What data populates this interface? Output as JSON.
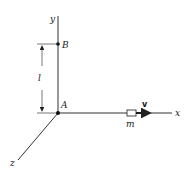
{
  "diagram": {
    "axes": {
      "x_label": "x",
      "y_label": "y",
      "z_label": "z"
    },
    "points": {
      "origin_label": "A",
      "upper_label": "B"
    },
    "dimension": {
      "label": "l"
    },
    "particle": {
      "mass_label": "m",
      "velocity_label": "v"
    },
    "colors": {
      "line": "#333333",
      "background": "#ffffff"
    }
  }
}
